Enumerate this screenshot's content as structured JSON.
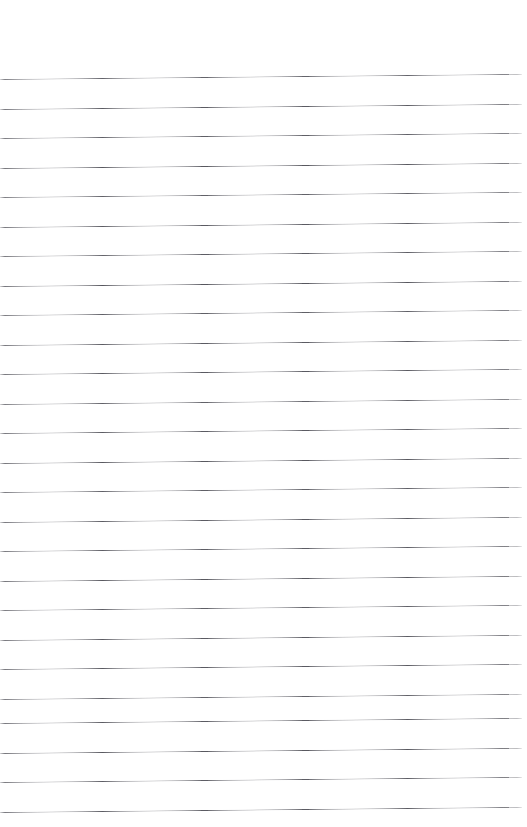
{
  "document": {
    "kind": "scanned-lined-paper",
    "title": "Lined Paper Scan",
    "page_width": 527,
    "page_height": 827,
    "background_color": "#ffffff",
    "text_content": "",
    "has_handwriting": false,
    "has_margin_rule": false,
    "has_holes": false
  },
  "ruling": {
    "line_count": 26,
    "line_spacing_px": 29.5,
    "first_line_y_left": 79,
    "first_line_y_right": 74,
    "last_line_y_left": 812,
    "line_color": "#4a4a52",
    "line_thickness_px": 1,
    "line_start_x": 0,
    "line_end_x": 522,
    "skew_rise_px": 5,
    "skew_degrees": -0.54,
    "top_margin_px": 79,
    "orientation": "horizontal",
    "lines": [
      {
        "index": 1,
        "y_left": 79.0,
        "opacity": 0.86
      },
      {
        "index": 2,
        "y_left": 108.5,
        "opacity": 0.9
      },
      {
        "index": 3,
        "y_left": 138.0,
        "opacity": 0.88
      },
      {
        "index": 4,
        "y_left": 167.5,
        "opacity": 0.92
      },
      {
        "index": 5,
        "y_left": 197.0,
        "opacity": 0.87
      },
      {
        "index": 6,
        "y_left": 226.5,
        "opacity": 0.9
      },
      {
        "index": 7,
        "y_left": 256.0,
        "opacity": 0.89
      },
      {
        "index": 8,
        "y_left": 285.5,
        "opacity": 0.93
      },
      {
        "index": 9,
        "y_left": 315.0,
        "opacity": 0.88
      },
      {
        "index": 10,
        "y_left": 344.5,
        "opacity": 0.9
      },
      {
        "index": 11,
        "y_left": 374.0,
        "opacity": 0.91
      },
      {
        "index": 12,
        "y_left": 403.5,
        "opacity": 0.87
      },
      {
        "index": 13,
        "y_left": 433.0,
        "opacity": 0.9
      },
      {
        "index": 14,
        "y_left": 462.5,
        "opacity": 0.92
      },
      {
        "index": 15,
        "y_left": 492.0,
        "opacity": 0.88
      },
      {
        "index": 16,
        "y_left": 521.5,
        "opacity": 0.9
      },
      {
        "index": 17,
        "y_left": 551.0,
        "opacity": 0.89
      },
      {
        "index": 18,
        "y_left": 580.5,
        "opacity": 0.92
      },
      {
        "index": 19,
        "y_left": 610.0,
        "opacity": 0.88
      },
      {
        "index": 20,
        "y_left": 639.5,
        "opacity": 0.9
      },
      {
        "index": 21,
        "y_left": 669.0,
        "opacity": 0.91
      },
      {
        "index": 22,
        "y_left": 698.5,
        "opacity": 0.87
      },
      {
        "index": 23,
        "y_left": 723.0,
        "opacity": 0.9
      },
      {
        "index": 24,
        "y_left": 752.5,
        "opacity": 0.92
      },
      {
        "index": 25,
        "y_left": 782.0,
        "opacity": 0.89
      },
      {
        "index": 26,
        "y_left": 811.5,
        "opacity": 0.9
      }
    ]
  }
}
